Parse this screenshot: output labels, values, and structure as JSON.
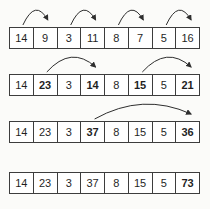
{
  "figure": {
    "colors": {
      "background": "#fbfbf9",
      "cell_background": "#ffffff",
      "border": "#3d3d3d",
      "text": "#1f1f1f",
      "arrow": "#2e2e2e"
    },
    "rows": [
      {
        "cells": [
          {
            "value": "14",
            "bold": false
          },
          {
            "value": "9",
            "bold": false
          },
          {
            "value": "3",
            "bold": false
          },
          {
            "value": "11",
            "bold": false
          },
          {
            "value": "8",
            "bold": false
          },
          {
            "value": "7",
            "bold": false
          },
          {
            "value": "5",
            "bold": false
          },
          {
            "value": "16",
            "bold": false
          }
        ],
        "arrows": [
          {
            "from": 0,
            "to": 1
          },
          {
            "from": 2,
            "to": 3
          },
          {
            "from": 4,
            "to": 5
          },
          {
            "from": 6,
            "to": 7
          }
        ]
      },
      {
        "cells": [
          {
            "value": "14",
            "bold": false
          },
          {
            "value": "23",
            "bold": true
          },
          {
            "value": "3",
            "bold": false
          },
          {
            "value": "14",
            "bold": true
          },
          {
            "value": "8",
            "bold": false
          },
          {
            "value": "15",
            "bold": true
          },
          {
            "value": "5",
            "bold": false
          },
          {
            "value": "21",
            "bold": true
          }
        ],
        "arrows": [
          {
            "from": 1,
            "to": 3
          },
          {
            "from": 5,
            "to": 7
          }
        ]
      },
      {
        "cells": [
          {
            "value": "14",
            "bold": false
          },
          {
            "value": "23",
            "bold": false
          },
          {
            "value": "3",
            "bold": false
          },
          {
            "value": "37",
            "bold": true
          },
          {
            "value": "8",
            "bold": false
          },
          {
            "value": "15",
            "bold": false
          },
          {
            "value": "5",
            "bold": false
          },
          {
            "value": "36",
            "bold": true
          }
        ],
        "arrows": [
          {
            "from": 3,
            "to": 7
          }
        ]
      },
      {
        "cells": [
          {
            "value": "14",
            "bold": false
          },
          {
            "value": "23",
            "bold": false
          },
          {
            "value": "3",
            "bold": false
          },
          {
            "value": "37",
            "bold": false
          },
          {
            "value": "8",
            "bold": false
          },
          {
            "value": "15",
            "bold": false
          },
          {
            "value": "5",
            "bold": false
          },
          {
            "value": "73",
            "bold": true
          }
        ],
        "arrows": []
      }
    ]
  }
}
